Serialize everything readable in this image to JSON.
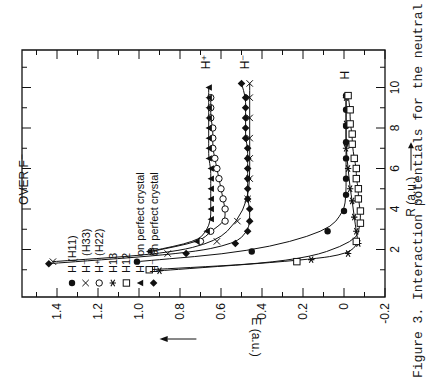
{
  "figure": {
    "caption": "Figure 3.  Interaction potentials for the neutral",
    "orientation": "rotated 90 degrees counter-clockwise"
  },
  "chart_data": {
    "type": "line",
    "title": "OVER F⁻",
    "xlabel": "R (a.u.)",
    "ylabel": "E (a.u.)",
    "xlim": [
      0,
      12
    ],
    "ylim": [
      -0.2,
      1.6
    ],
    "xticks": [
      2,
      4,
      6,
      8,
      10
    ],
    "yticks": [
      -0.2,
      0,
      0.2,
      0.4,
      0.6,
      0.8,
      1.0,
      1.2,
      1.4
    ],
    "grid": false,
    "legend_position": "upper left (rotated)",
    "curve_labels": [
      "H⁺",
      "H⁻",
      "H"
    ],
    "series": [
      {
        "name": "H (H11)",
        "marker": "filled-circle",
        "x": [
          1.4,
          1.9,
          2.9,
          3.9,
          4.7,
          5.5,
          6.5,
          7.3,
          8.1,
          8.9,
          9.6
        ],
        "y": [
          1.01,
          0.45,
          0.08,
          0.0,
          -0.01,
          -0.01,
          -0.01,
          -0.01,
          -0.01,
          -0.01,
          -0.01
        ]
      },
      {
        "name": "H⁻ (H33)",
        "marker": "x",
        "x": [
          1.4,
          1.8,
          2.4,
          3.4,
          4.5,
          5.5,
          6.5,
          7.5,
          8.5,
          9.5,
          10.2
        ],
        "y": [
          1.42,
          0.86,
          0.62,
          0.52,
          0.47,
          0.46,
          0.46,
          0.46,
          0.46,
          0.46,
          0.46
        ]
      },
      {
        "name": "H⁺ (H22)",
        "marker": "open-circle",
        "x": [
          1.9,
          2.4,
          2.9,
          3.4,
          4.0,
          4.5,
          5.0,
          5.5,
          6.0,
          6.5,
          7.0,
          7.5,
          8.0,
          8.5,
          9.0,
          9.5
        ],
        "y": [
          0.94,
          0.7,
          0.65,
          0.58,
          0.58,
          0.59,
          0.6,
          0.61,
          0.62,
          0.63,
          0.64,
          0.64,
          0.64,
          0.65,
          0.65,
          0.65
        ]
      },
      {
        "name": "H13",
        "marker": "asterisk",
        "x": [
          0.95,
          1.5,
          1.8,
          2.3,
          2.9,
          3.6,
          4.4,
          5.0,
          6.0,
          7.0,
          8.2,
          9.5
        ],
        "y": [
          0.9,
          0.16,
          -0.02,
          -0.07,
          -0.06,
          -0.05,
          -0.04,
          -0.03,
          -0.02,
          -0.01,
          -0.01,
          -0.01
        ]
      },
      {
        "name": "H12",
        "marker": "open-square",
        "x": [
          1.0,
          1.4,
          2.4,
          3.3,
          3.9,
          4.5,
          5.0,
          5.5,
          6.0,
          6.5,
          7.2,
          7.7,
          8.2,
          8.9,
          9.6
        ],
        "y": [
          0.95,
          0.23,
          -0.06,
          -0.08,
          -0.08,
          -0.07,
          -0.07,
          -0.06,
          -0.06,
          -0.05,
          -0.04,
          -0.04,
          -0.03,
          -0.03,
          -0.02
        ]
      },
      {
        "name": "H⁺ on perfect crystal",
        "marker": "filled-triangle",
        "x": [
          1.9,
          2.4,
          2.9,
          3.5,
          4.0,
          4.5,
          5.0,
          5.5,
          6.0,
          6.5,
          7.0,
          7.5,
          8.0,
          8.5,
          9.0,
          9.5,
          10.0
        ],
        "y": [
          0.95,
          0.72,
          0.67,
          0.65,
          0.65,
          0.65,
          0.65,
          0.65,
          0.65,
          0.66,
          0.66,
          0.66,
          0.66,
          0.66,
          0.66,
          0.66,
          0.66
        ]
      },
      {
        "name": "H⁻ on perfect crystal",
        "marker": "filled-diamond",
        "x": [
          1.3,
          1.8,
          2.3,
          2.9,
          3.4,
          4.0,
          4.5,
          5.0,
          5.5,
          6.0,
          6.5,
          7.0,
          7.5,
          8.0,
          8.5,
          9.0,
          9.5,
          10.2
        ],
        "y": [
          1.44,
          0.77,
          0.53,
          0.47,
          0.46,
          0.46,
          0.47,
          0.47,
          0.47,
          0.47,
          0.47,
          0.47,
          0.48,
          0.48,
          0.48,
          0.48,
          0.48,
          0.5
        ]
      }
    ]
  }
}
